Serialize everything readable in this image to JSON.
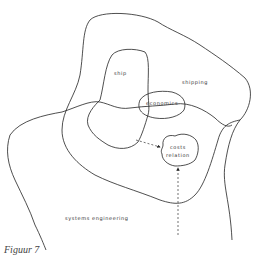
{
  "diagram": {
    "regions": [
      {
        "id": "ship",
        "label": "ship"
      },
      {
        "id": "shipping",
        "label": "shipping"
      },
      {
        "id": "economics",
        "label": "economics"
      },
      {
        "id": "costs-relation",
        "label_line1": "costs",
        "label_line2": "relation"
      },
      {
        "id": "systems-engineering",
        "label": "systems engineering"
      }
    ],
    "arrows": [
      {
        "from": "ship",
        "to": "costs-relation",
        "style": "dashed"
      },
      {
        "from": "systems-engineering",
        "to": "costs-relation",
        "style": "dashed"
      }
    ],
    "caption": "Figuur 7",
    "stroke_color": "#222222"
  }
}
